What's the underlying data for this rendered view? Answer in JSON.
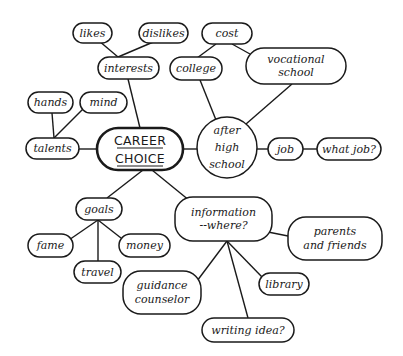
{
  "diagram": {
    "type": "mind-map",
    "center": {
      "id": "career",
      "lines": [
        "CAREER",
        "CHOICE"
      ],
      "x": 97,
      "y": 128,
      "w": 86,
      "h": 42
    },
    "nodes": [
      {
        "id": "likes",
        "lines": [
          "likes"
        ],
        "shape": "pill",
        "x": 73,
        "y": 23,
        "w": 39,
        "h": 20
      },
      {
        "id": "dislikes",
        "lines": [
          "dislikes"
        ],
        "shape": "pill",
        "x": 139,
        "y": 23,
        "w": 49,
        "h": 20
      },
      {
        "id": "interests",
        "lines": [
          "interests"
        ],
        "shape": "pill",
        "x": 98,
        "y": 57,
        "w": 61,
        "h": 22
      },
      {
        "id": "hands",
        "lines": [
          "hands"
        ],
        "shape": "pill",
        "x": 28,
        "y": 92,
        "w": 45,
        "h": 21
      },
      {
        "id": "mind",
        "lines": [
          "mind"
        ],
        "shape": "pill",
        "x": 80,
        "y": 92,
        "w": 47,
        "h": 21
      },
      {
        "id": "talents",
        "lines": [
          "talents"
        ],
        "shape": "pill",
        "x": 26,
        "y": 138,
        "w": 53,
        "h": 21
      },
      {
        "id": "cost",
        "lines": [
          "cost"
        ],
        "shape": "pill",
        "x": 202,
        "y": 23,
        "w": 50,
        "h": 21
      },
      {
        "id": "college",
        "lines": [
          "college"
        ],
        "shape": "pill",
        "x": 170,
        "y": 57,
        "w": 52,
        "h": 23
      },
      {
        "id": "vocational",
        "lines": [
          "vocational",
          "school"
        ],
        "shape": "pill",
        "x": 246,
        "y": 48,
        "w": 100,
        "h": 36
      },
      {
        "id": "afterhs",
        "lines": [
          "after",
          "high",
          "school"
        ],
        "shape": "circle",
        "x": 197,
        "y": 117,
        "w": 60,
        "h": 61
      },
      {
        "id": "job",
        "lines": [
          "job"
        ],
        "shape": "pill",
        "x": 268,
        "y": 138,
        "w": 35,
        "h": 22
      },
      {
        "id": "whatjob",
        "lines": [
          "what job?"
        ],
        "shape": "pill",
        "x": 317,
        "y": 138,
        "w": 64,
        "h": 22
      },
      {
        "id": "goals",
        "lines": [
          "goals"
        ],
        "shape": "pill",
        "x": 76,
        "y": 198,
        "w": 46,
        "h": 22
      },
      {
        "id": "fame",
        "lines": [
          "fame"
        ],
        "shape": "pill",
        "x": 28,
        "y": 234,
        "w": 45,
        "h": 23
      },
      {
        "id": "money",
        "lines": [
          "money"
        ],
        "shape": "pill",
        "x": 119,
        "y": 234,
        "w": 51,
        "h": 23
      },
      {
        "id": "travel",
        "lines": [
          "travel"
        ],
        "shape": "pill",
        "x": 74,
        "y": 261,
        "w": 47,
        "h": 22
      },
      {
        "id": "information",
        "lines": [
          "information",
          "--where?"
        ],
        "shape": "pill",
        "x": 175,
        "y": 197,
        "w": 97,
        "h": 44
      },
      {
        "id": "parents",
        "lines": [
          "parents",
          "and friends"
        ],
        "shape": "pill",
        "x": 288,
        "y": 217,
        "w": 94,
        "h": 43
      },
      {
        "id": "library",
        "lines": [
          "library"
        ],
        "shape": "pill",
        "x": 259,
        "y": 273,
        "w": 50,
        "h": 22
      },
      {
        "id": "guidance",
        "lines": [
          "guidance",
          "counselor"
        ],
        "shape": "pill",
        "x": 123,
        "y": 271,
        "w": 78,
        "h": 43
      },
      {
        "id": "writing",
        "lines": [
          "writing idea?"
        ],
        "shape": "pill",
        "x": 202,
        "y": 318,
        "w": 92,
        "h": 24
      }
    ],
    "edges": [
      {
        "from": [
          92,
          35
        ],
        "to": [
          118,
          57
        ]
      },
      {
        "from": [
          158,
          40
        ],
        "to": [
          118,
          57
        ]
      },
      {
        "from": [
          128,
          79
        ],
        "to": [
          140,
          128
        ]
      },
      {
        "from": [
          52,
          113
        ],
        "to": [
          54,
          138
        ]
      },
      {
        "from": [
          84,
          108
        ],
        "to": [
          54,
          138
        ]
      },
      {
        "from": [
          79,
          149
        ],
        "to": [
          97,
          149
        ]
      },
      {
        "from": [
          216,
          44
        ],
        "to": [
          197,
          58
        ]
      },
      {
        "from": [
          232,
          44
        ],
        "to": [
          250,
          54
        ]
      },
      {
        "from": [
          200,
          80
        ],
        "to": [
          216,
          120
        ]
      },
      {
        "from": [
          292,
          84
        ],
        "to": [
          246,
          124
        ]
      },
      {
        "from": [
          183,
          149
        ],
        "to": [
          197,
          149
        ]
      },
      {
        "from": [
          257,
          149
        ],
        "to": [
          268,
          149
        ]
      },
      {
        "from": [
          303,
          149
        ],
        "to": [
          317,
          149
        ]
      },
      {
        "from": [
          143,
          170
        ],
        "to": [
          107,
          198
        ]
      },
      {
        "from": [
          152,
          170
        ],
        "to": [
          190,
          201
        ]
      },
      {
        "from": [
          98,
          220
        ],
        "to": [
          66,
          242
        ]
      },
      {
        "from": [
          98,
          220
        ],
        "to": [
          98,
          261
        ]
      },
      {
        "from": [
          98,
          220
        ],
        "to": [
          121,
          238
        ]
      },
      {
        "from": [
          268,
          232
        ],
        "to": [
          288,
          236
        ]
      },
      {
        "from": [
          227,
          241
        ],
        "to": [
          197,
          281
        ]
      },
      {
        "from": [
          227,
          241
        ],
        "to": [
          248,
          318
        ]
      },
      {
        "from": [
          227,
          241
        ],
        "to": [
          262,
          277
        ]
      }
    ]
  }
}
